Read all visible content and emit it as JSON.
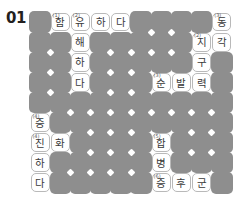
{
  "puzzle": {
    "number": "01",
    "type": "korean-crossword",
    "grid": {
      "columns": 10,
      "rows": 9
    },
    "colors": {
      "block": "#8e8e8e",
      "open": "#ffffff",
      "open_border": "#b9b9b9",
      "text": "#3a3a3a",
      "clue_number": "#5a5a5a",
      "page_number": "#231f20",
      "background": "#ffffff"
    },
    "cells": [
      {
        "r": 0,
        "c": 0,
        "state": "block"
      },
      {
        "r": 0,
        "c": 1,
        "state": "open",
        "letter": "함",
        "clue": "(1)"
      },
      {
        "r": 0,
        "c": 2,
        "state": "open",
        "letter": "유",
        "clue": "(2)"
      },
      {
        "r": 0,
        "c": 3,
        "state": "open",
        "letter": "하"
      },
      {
        "r": 0,
        "c": 4,
        "state": "open",
        "letter": "다"
      },
      {
        "r": 0,
        "c": 5,
        "state": "block"
      },
      {
        "r": 0,
        "c": 6,
        "state": "block"
      },
      {
        "r": 0,
        "c": 7,
        "state": "block"
      },
      {
        "r": 0,
        "c": 8,
        "state": "block"
      },
      {
        "r": 0,
        "c": 9,
        "state": "open",
        "letter": "동",
        "clue": "(3)"
      },
      {
        "r": 1,
        "c": 0,
        "state": "block"
      },
      {
        "r": 1,
        "c": 1,
        "state": "block"
      },
      {
        "r": 1,
        "c": 2,
        "state": "open",
        "letter": "해"
      },
      {
        "r": 1,
        "c": 3,
        "state": "block"
      },
      {
        "r": 1,
        "c": 4,
        "state": "block"
      },
      {
        "r": 1,
        "c": 5,
        "state": "block"
      },
      {
        "r": 1,
        "c": 6,
        "state": "block"
      },
      {
        "r": 1,
        "c": 7,
        "state": "block"
      },
      {
        "r": 1,
        "c": 8,
        "state": "open",
        "letter": "지",
        "clue": "(2)"
      },
      {
        "r": 1,
        "c": 9,
        "state": "open",
        "letter": "각"
      },
      {
        "r": 2,
        "c": 0,
        "state": "block"
      },
      {
        "r": 2,
        "c": 1,
        "state": "block"
      },
      {
        "r": 2,
        "c": 2,
        "state": "open",
        "letter": "하"
      },
      {
        "r": 2,
        "c": 3,
        "state": "block"
      },
      {
        "r": 2,
        "c": 4,
        "state": "block"
      },
      {
        "r": 2,
        "c": 5,
        "state": "block"
      },
      {
        "r": 2,
        "c": 6,
        "state": "block"
      },
      {
        "r": 2,
        "c": 7,
        "state": "block"
      },
      {
        "r": 2,
        "c": 8,
        "state": "open",
        "letter": "구"
      },
      {
        "r": 2,
        "c": 9,
        "state": "block"
      },
      {
        "r": 3,
        "c": 0,
        "state": "block"
      },
      {
        "r": 3,
        "c": 1,
        "state": "block"
      },
      {
        "r": 3,
        "c": 2,
        "state": "open",
        "letter": "다"
      },
      {
        "r": 3,
        "c": 3,
        "state": "block"
      },
      {
        "r": 3,
        "c": 4,
        "state": "block"
      },
      {
        "r": 3,
        "c": 5,
        "state": "block"
      },
      {
        "r": 3,
        "c": 6,
        "state": "open",
        "letter": "순",
        "clue": "(3)"
      },
      {
        "r": 3,
        "c": 7,
        "state": "open",
        "letter": "발"
      },
      {
        "r": 3,
        "c": 8,
        "state": "open",
        "letter": "력"
      },
      {
        "r": 3,
        "c": 9,
        "state": "block"
      },
      {
        "r": 4,
        "c": 0,
        "state": "block"
      },
      {
        "r": 4,
        "c": 1,
        "state": "block"
      },
      {
        "r": 4,
        "c": 2,
        "state": "block"
      },
      {
        "r": 4,
        "c": 3,
        "state": "block"
      },
      {
        "r": 4,
        "c": 4,
        "state": "block"
      },
      {
        "r": 4,
        "c": 5,
        "state": "block"
      },
      {
        "r": 4,
        "c": 6,
        "state": "block"
      },
      {
        "r": 4,
        "c": 7,
        "state": "block"
      },
      {
        "r": 4,
        "c": 8,
        "state": "block"
      },
      {
        "r": 4,
        "c": 9,
        "state": "block"
      },
      {
        "r": 5,
        "c": 0,
        "state": "open",
        "letter": "증",
        "clue": "(4)"
      },
      {
        "r": 5,
        "c": 1,
        "state": "block"
      },
      {
        "r": 5,
        "c": 2,
        "state": "block"
      },
      {
        "r": 5,
        "c": 3,
        "state": "block"
      },
      {
        "r": 5,
        "c": 4,
        "state": "block"
      },
      {
        "r": 5,
        "c": 5,
        "state": "block"
      },
      {
        "r": 5,
        "c": 6,
        "state": "block"
      },
      {
        "r": 5,
        "c": 7,
        "state": "block"
      },
      {
        "r": 5,
        "c": 8,
        "state": "block"
      },
      {
        "r": 5,
        "c": 9,
        "state": "block"
      },
      {
        "r": 6,
        "c": 0,
        "state": "open",
        "letter": "진",
        "clue": "(4)"
      },
      {
        "r": 6,
        "c": 1,
        "state": "open",
        "letter": "화"
      },
      {
        "r": 6,
        "c": 2,
        "state": "block"
      },
      {
        "r": 6,
        "c": 3,
        "state": "block"
      },
      {
        "r": 6,
        "c": 4,
        "state": "block"
      },
      {
        "r": 6,
        "c": 5,
        "state": "block"
      },
      {
        "r": 6,
        "c": 6,
        "state": "open",
        "letter": "합",
        "clue": "(5)"
      },
      {
        "r": 6,
        "c": 7,
        "state": "block"
      },
      {
        "r": 6,
        "c": 8,
        "state": "block"
      },
      {
        "r": 6,
        "c": 9,
        "state": "block"
      },
      {
        "r": 7,
        "c": 0,
        "state": "open",
        "letter": "하"
      },
      {
        "r": 7,
        "c": 1,
        "state": "block"
      },
      {
        "r": 7,
        "c": 2,
        "state": "block"
      },
      {
        "r": 7,
        "c": 3,
        "state": "block"
      },
      {
        "r": 7,
        "c": 4,
        "state": "block"
      },
      {
        "r": 7,
        "c": 5,
        "state": "block"
      },
      {
        "r": 7,
        "c": 6,
        "state": "open",
        "letter": "병"
      },
      {
        "r": 7,
        "c": 7,
        "state": "block"
      },
      {
        "r": 7,
        "c": 8,
        "state": "block"
      },
      {
        "r": 7,
        "c": 9,
        "state": "block"
      },
      {
        "r": 8,
        "c": 0,
        "state": "open",
        "letter": "다"
      },
      {
        "r": 8,
        "c": 1,
        "state": "block"
      },
      {
        "r": 8,
        "c": 2,
        "state": "block"
      },
      {
        "r": 8,
        "c": 3,
        "state": "block"
      },
      {
        "r": 8,
        "c": 4,
        "state": "block"
      },
      {
        "r": 8,
        "c": 5,
        "state": "block"
      },
      {
        "r": 8,
        "c": 6,
        "state": "open",
        "letter": "증",
        "clue": "(6)"
      },
      {
        "r": 8,
        "c": 7,
        "state": "open",
        "letter": "후"
      },
      {
        "r": 8,
        "c": 8,
        "state": "open",
        "letter": "군"
      },
      {
        "r": 8,
        "c": 9,
        "state": "block"
      }
    ]
  }
}
